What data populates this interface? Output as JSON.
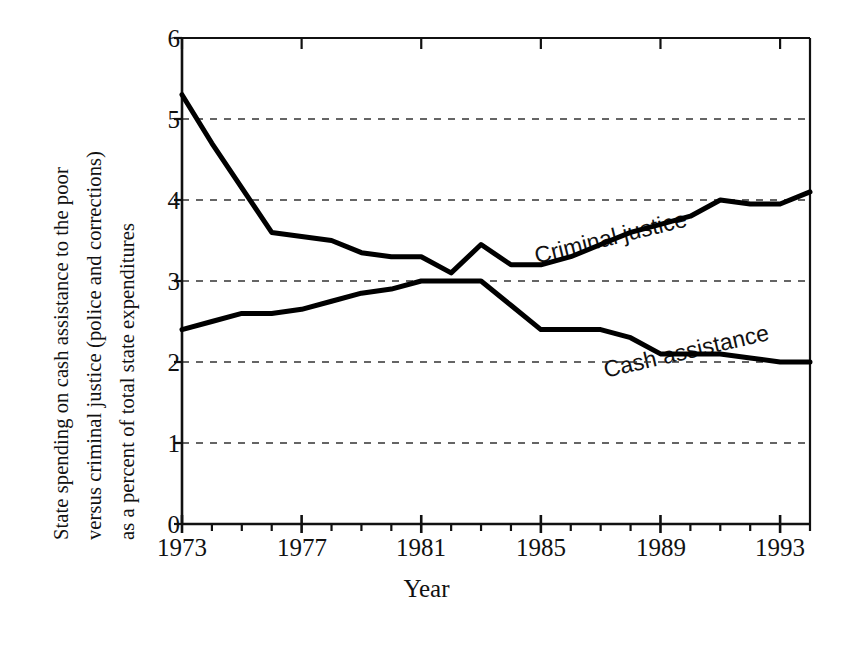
{
  "chart_data": {
    "type": "line",
    "title": "",
    "xlabel": "Year",
    "ylabel": "State spending on cash assistance to the poor versus criminal justice (police and corrections) as a percent of total state expenditures",
    "ylabel_lines": [
      "State spending on cash assistance to the poor",
      "versus criminal justice (police and corrections)",
      "as a percent of total state expenditures"
    ],
    "xlim": [
      1973,
      1994
    ],
    "ylim": [
      0,
      6
    ],
    "ytick_labels": [
      "0",
      "1",
      "2",
      "3",
      "4",
      "5",
      "6"
    ],
    "ytick_values": [
      0,
      1,
      2,
      3,
      4,
      5,
      6
    ],
    "xtick_labels": [
      "1973",
      "1977",
      "1981",
      "1985",
      "1989",
      "1993"
    ],
    "xtick_values": [
      1973,
      1977,
      1981,
      1985,
      1989,
      1993
    ],
    "xtick_minor_step": 1,
    "grid": "horizontal dashed gridlines at y = 1, 2, 3, 4, 5",
    "gridlines": [
      1,
      2,
      3,
      4,
      5
    ],
    "legend_position": "inline annotations on curves",
    "x": [
      1973,
      1974,
      1975,
      1976,
      1977,
      1978,
      1979,
      1980,
      1981,
      1982,
      1983,
      1984,
      1985,
      1986,
      1987,
      1988,
      1989,
      1990,
      1991,
      1992,
      1993,
      1994
    ],
    "series": [
      {
        "name": "Criminal justice",
        "label": "Criminal justice",
        "color": "#000000",
        "values": [
          5.3,
          4.7,
          4.15,
          3.6,
          3.55,
          3.5,
          3.35,
          3.3,
          3.3,
          3.1,
          3.45,
          3.2,
          3.2,
          3.3,
          3.45,
          3.6,
          3.7,
          3.8,
          4.0,
          3.95,
          3.95,
          4.1
        ]
      },
      {
        "name": "Cash assistance",
        "label": "Cash assistance",
        "color": "#000000",
        "values": [
          2.4,
          2.5,
          2.6,
          2.6,
          2.65,
          2.75,
          2.85,
          2.9,
          3.0,
          3.0,
          3.0,
          2.7,
          2.4,
          2.4,
          2.4,
          2.3,
          2.1,
          2.1,
          2.1,
          2.05,
          2.0,
          2.0
        ]
      }
    ]
  }
}
